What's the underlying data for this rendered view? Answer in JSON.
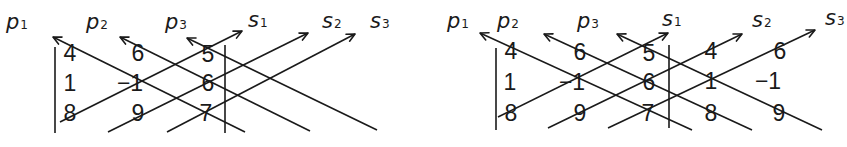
{
  "figure": {
    "color": "#1a1a1a",
    "panels": [
      {
        "name": "left-panel",
        "matrix": [
          [
            "4",
            "6",
            "5"
          ],
          [
            "1",
            "−1",
            "6"
          ],
          [
            "8",
            "9",
            "7"
          ]
        ],
        "cells": [
          {
            "text": "4",
            "x": 70,
            "y": 61
          },
          {
            "text": "6",
            "x": 138,
            "y": 61
          },
          {
            "text": "5",
            "x": 208,
            "y": 62
          },
          {
            "text": "1",
            "x": 70,
            "y": 91
          },
          {
            "text": "−1",
            "x": 130,
            "y": 91
          },
          {
            "text": "6",
            "x": 208,
            "y": 91
          },
          {
            "text": "8",
            "x": 70,
            "y": 121
          },
          {
            "text": "9",
            "x": 138,
            "y": 121
          },
          {
            "text": "7",
            "x": 206,
            "y": 121
          }
        ],
        "bars": [
          {
            "x": 55,
            "y1": 47,
            "y2": 133
          },
          {
            "x": 225,
            "y1": 45,
            "y2": 133
          }
        ],
        "labels": [
          {
            "main": "p",
            "sub": "1",
            "x": 6,
            "y": 29
          },
          {
            "main": "p",
            "sub": "2",
            "x": 86,
            "y": 29
          },
          {
            "main": "p",
            "sub": "3",
            "x": 165,
            "y": 29
          },
          {
            "main": "s",
            "sub": "1",
            "x": 248,
            "y": 27
          },
          {
            "main": "s",
            "sub": "2",
            "x": 322,
            "y": 28
          },
          {
            "main": "s",
            "sub": "3",
            "x": 370,
            "y": 28
          }
        ],
        "product_lines": [
          {
            "name": "p1",
            "from": [
              245,
              132
            ],
            "to": [
              53,
              37
            ]
          },
          {
            "name": "p2",
            "from": [
              310,
              131
            ],
            "to": [
              120,
              37
            ]
          },
          {
            "name": "p3",
            "from": [
              377,
              130
            ],
            "to": [
              187,
              38
            ]
          },
          {
            "name": "s1",
            "from": [
              60,
              122
            ],
            "to": [
              242,
              31
            ]
          },
          {
            "name": "s2",
            "from": [
              108,
              132
            ],
            "to": [
              308,
              33
            ]
          },
          {
            "name": "s3",
            "from": [
              167,
              132
            ],
            "to": [
              355,
              34
            ]
          }
        ]
      },
      {
        "name": "right-panel",
        "matrix": [
          [
            "4",
            "6",
            "5",
            "4",
            "6"
          ],
          [
            "1",
            "−1",
            "6",
            "1",
            "−1"
          ],
          [
            "8",
            "9",
            "7",
            "8",
            "9"
          ]
        ],
        "cells": [
          {
            "text": "4",
            "x": 511,
            "y": 59
          },
          {
            "text": "6",
            "x": 580,
            "y": 60
          },
          {
            "text": "5",
            "x": 649,
            "y": 61
          },
          {
            "text": "4",
            "x": 711,
            "y": 59
          },
          {
            "text": "6",
            "x": 780,
            "y": 59
          },
          {
            "text": "1",
            "x": 510,
            "y": 90
          },
          {
            "text": "−1",
            "x": 572,
            "y": 90
          },
          {
            "text": "6",
            "x": 649,
            "y": 90
          },
          {
            "text": "1",
            "x": 711,
            "y": 89
          },
          {
            "text": "−1",
            "x": 768,
            "y": 89
          },
          {
            "text": "8",
            "x": 511,
            "y": 121
          },
          {
            "text": "9",
            "x": 580,
            "y": 121
          },
          {
            "text": "7",
            "x": 648,
            "y": 121
          },
          {
            "text": "8",
            "x": 711,
            "y": 121
          },
          {
            "text": "9",
            "x": 779,
            "y": 121
          }
        ],
        "bars": [
          {
            "x": 496,
            "y1": 48,
            "y2": 130
          },
          {
            "x": 669,
            "y1": 45,
            "y2": 128
          }
        ],
        "labels": [
          {
            "main": "p",
            "sub": "1",
            "x": 447,
            "y": 28
          },
          {
            "main": "p",
            "sub": "2",
            "x": 497,
            "y": 28
          },
          {
            "main": "p",
            "sub": "3",
            "x": 577,
            "y": 28
          },
          {
            "main": "s",
            "sub": "1",
            "x": 662,
            "y": 26
          },
          {
            "main": "s",
            "sub": "2",
            "x": 752,
            "y": 27
          },
          {
            "main": "s",
            "sub": "3",
            "x": 825,
            "y": 25
          }
        ],
        "product_lines": [
          {
            "name": "p1",
            "from": [
              692,
              130
            ],
            "to": [
              480,
              33
            ]
          },
          {
            "name": "p2",
            "from": [
              752,
              130
            ],
            "to": [
              544,
              34
            ]
          },
          {
            "name": "p3",
            "from": [
              822,
              130
            ],
            "to": [
              617,
              34
            ]
          },
          {
            "name": "s1",
            "from": [
              498,
              117
            ],
            "to": [
              668,
              33
            ]
          },
          {
            "name": "s2",
            "from": [
              548,
              128
            ],
            "to": [
              742,
              34
            ]
          },
          {
            "name": "s3",
            "from": [
              608,
              128
            ],
            "to": [
              815,
              30
            ]
          }
        ]
      }
    ]
  }
}
